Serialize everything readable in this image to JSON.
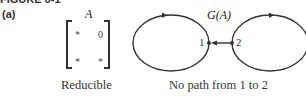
{
  "figure": {
    "title": "FIGURE 6-1",
    "panel_label": "(a)"
  },
  "matrix": {
    "name": "A",
    "entries": [
      [
        "*",
        "0"
      ],
      [
        "*",
        "*"
      ]
    ],
    "caption": "Reducible"
  },
  "graph": {
    "title": "G(A)",
    "nodes": [
      {
        "id": "1",
        "label": "1",
        "self_loop": true
      },
      {
        "id": "2",
        "label": "2",
        "self_loop": true
      }
    ],
    "edges": [
      {
        "from": "2",
        "to": "1"
      }
    ],
    "caption": "No path from 1 to 2"
  }
}
